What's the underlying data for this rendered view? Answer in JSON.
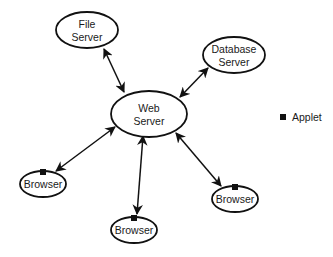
{
  "diagram": {
    "colors": {
      "stroke": "#111111",
      "fill": "#ffffff",
      "text": "#1a1a1a",
      "applet": "#111111"
    },
    "nodes": [
      {
        "id": "file-server",
        "lines": [
          "File",
          "Server"
        ],
        "cx": 87,
        "cy": 30,
        "rx": 31,
        "ry": 18,
        "applet": false
      },
      {
        "id": "database-server",
        "lines": [
          "Database",
          "Server"
        ],
        "cx": 234,
        "cy": 55,
        "rx": 31,
        "ry": 18,
        "applet": false
      },
      {
        "id": "web-server",
        "lines": [
          "Web",
          "Server"
        ],
        "cx": 149,
        "cy": 114,
        "rx": 38,
        "ry": 23,
        "applet": false
      },
      {
        "id": "browser-left",
        "lines": [
          "Browser"
        ],
        "cx": 43,
        "cy": 184,
        "rx": 23,
        "ry": 13,
        "applet": true
      },
      {
        "id": "browser-bottom",
        "lines": [
          "Browser"
        ],
        "cx": 134,
        "cy": 230,
        "rx": 23,
        "ry": 13,
        "applet": true
      },
      {
        "id": "browser-right",
        "lines": [
          "Browser"
        ],
        "cx": 235,
        "cy": 199,
        "rx": 23,
        "ry": 13,
        "applet": true
      }
    ],
    "edges": [
      {
        "from": "file-server",
        "to": "web-server",
        "x1": 104,
        "y1": 49,
        "x2": 124,
        "y2": 92,
        "bidirectional": true
      },
      {
        "from": "database-server",
        "to": "web-server",
        "x1": 208,
        "y1": 68,
        "x2": 180,
        "y2": 97,
        "bidirectional": true
      },
      {
        "from": "web-server",
        "to": "browser-left",
        "x1": 115,
        "y1": 127,
        "x2": 56,
        "y2": 171,
        "bidirectional": true
      },
      {
        "from": "web-server",
        "to": "browser-bottom",
        "x1": 143,
        "y1": 136,
        "x2": 137,
        "y2": 214,
        "bidirectional": true
      },
      {
        "from": "web-server",
        "to": "browser-right",
        "x1": 176,
        "y1": 133,
        "x2": 221,
        "y2": 186,
        "bidirectional": true
      }
    ],
    "legend": {
      "items": [
        {
          "symbol": "filled-square",
          "label": "Applet"
        }
      ]
    }
  }
}
